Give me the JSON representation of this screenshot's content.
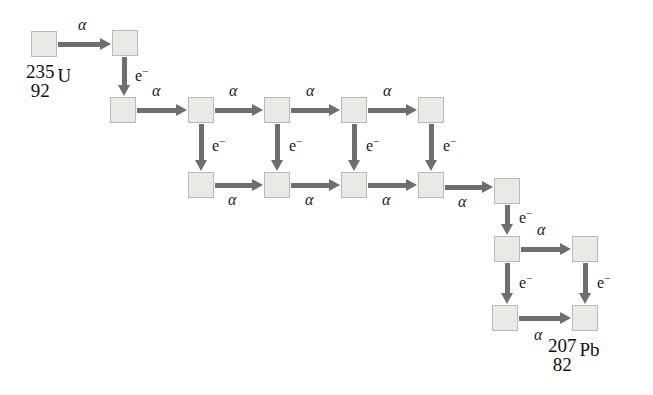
{
  "diagram": {
    "colors": {
      "box_fill": "#e9e9e6",
      "box_border": "#b9b9b5",
      "arrow": "#6e6e6e",
      "text": "#111111",
      "background": "#ffffff"
    },
    "labels": {
      "alpha": "α",
      "electron_base": "e",
      "electron_sup": "−"
    },
    "nuclides": [
      {
        "id": "start",
        "mass": "235",
        "atomic": "92",
        "symbol": "U"
      },
      {
        "id": "end",
        "mass": "207",
        "atomic": "82",
        "symbol": "Pb"
      }
    ],
    "boxes": [
      {
        "name": "nuclide-box-r1-c1",
        "x": 31,
        "y": 31
      },
      {
        "name": "nuclide-box-r1-c2",
        "x": 112,
        "y": 30
      },
      {
        "name": "nuclide-box-r2-c1",
        "x": 110,
        "y": 97
      },
      {
        "name": "nuclide-box-r2-c2",
        "x": 188,
        "y": 97
      },
      {
        "name": "nuclide-box-r2-c3",
        "x": 264,
        "y": 97
      },
      {
        "name": "nuclide-box-r2-c4",
        "x": 341,
        "y": 97
      },
      {
        "name": "nuclide-box-r2-c5",
        "x": 418,
        "y": 97
      },
      {
        "name": "nuclide-box-r3-c1",
        "x": 188,
        "y": 172
      },
      {
        "name": "nuclide-box-r3-c2",
        "x": 264,
        "y": 172
      },
      {
        "name": "nuclide-box-r3-c3",
        "x": 341,
        "y": 172
      },
      {
        "name": "nuclide-box-r3-c4",
        "x": 418,
        "y": 172
      },
      {
        "name": "nuclide-box-r3-c5",
        "x": 494,
        "y": 178
      },
      {
        "name": "nuclide-box-r4-c1",
        "x": 494,
        "y": 236
      },
      {
        "name": "nuclide-box-r4-c2",
        "x": 572,
        "y": 236
      },
      {
        "name": "nuclide-box-r5-c1",
        "x": 492,
        "y": 305
      },
      {
        "name": "nuclide-box-r5-c2",
        "x": 572,
        "y": 305
      }
    ],
    "alpha_arrows": [
      {
        "name": "alpha-arrow-r1-c1-c2",
        "x": 58,
        "y": 42,
        "len": 43,
        "label_x": 78,
        "label_y": 17
      },
      {
        "name": "alpha-arrow-r2-c1-c2",
        "x": 137,
        "y": 108,
        "len": 40,
        "label_x": 152,
        "label_y": 83
      },
      {
        "name": "alpha-arrow-r2-c2-c3",
        "x": 215,
        "y": 108,
        "len": 38,
        "label_x": 229,
        "label_y": 83
      },
      {
        "name": "alpha-arrow-r2-c3-c4",
        "x": 291,
        "y": 108,
        "len": 39,
        "label_x": 306,
        "label_y": 83
      },
      {
        "name": "alpha-arrow-r2-c4-c5",
        "x": 368,
        "y": 108,
        "len": 39,
        "label_x": 383,
        "label_y": 83
      },
      {
        "name": "alpha-arrow-r3-c1-c2",
        "x": 215,
        "y": 183,
        "len": 38,
        "label_x": 228,
        "label_y": 192
      },
      {
        "name": "alpha-arrow-r3-c2-c3",
        "x": 291,
        "y": 183,
        "len": 39,
        "label_x": 305,
        "label_y": 192
      },
      {
        "name": "alpha-arrow-r3-c3-c4",
        "x": 368,
        "y": 183,
        "len": 39,
        "label_x": 382,
        "label_y": 192
      },
      {
        "name": "alpha-arrow-r3-c4-c5",
        "x": 445,
        "y": 185,
        "len": 38,
        "label_x": 458,
        "label_y": 194
      },
      {
        "name": "alpha-arrow-r4-c1-c2",
        "x": 521,
        "y": 247,
        "len": 40,
        "label_x": 537,
        "label_y": 222
      },
      {
        "name": "alpha-arrow-r5-c1-c2",
        "x": 519,
        "y": 316,
        "len": 42,
        "label_x": 534,
        "label_y": 327
      }
    ],
    "electron_arrows": [
      {
        "name": "electron-arrow-r1c2-r2c1",
        "x": 122,
        "y": 57,
        "len": 29,
        "label_x": 135,
        "label_y": 66
      },
      {
        "name": "electron-arrow-r2c2-r3c1",
        "x": 199,
        "y": 124,
        "len": 37,
        "label_x": 212,
        "label_y": 136
      },
      {
        "name": "electron-arrow-r2c3-r3c2",
        "x": 275,
        "y": 124,
        "len": 37,
        "label_x": 289,
        "label_y": 136
      },
      {
        "name": "electron-arrow-r2c4-r3c3",
        "x": 352,
        "y": 124,
        "len": 37,
        "label_x": 366,
        "label_y": 136
      },
      {
        "name": "electron-arrow-r2c5-r3c4",
        "x": 429,
        "y": 124,
        "len": 37,
        "label_x": 443,
        "label_y": 136
      },
      {
        "name": "electron-arrow-r3c5-r4c1",
        "x": 505,
        "y": 205,
        "len": 20,
        "label_x": 519,
        "label_y": 208
      },
      {
        "name": "electron-arrow-r4c1-r5c1",
        "x": 505,
        "y": 263,
        "len": 31,
        "label_x": 519,
        "label_y": 273
      },
      {
        "name": "electron-arrow-r4c2-r5c2",
        "x": 583,
        "y": 263,
        "len": 31,
        "label_x": 597,
        "label_y": 273
      }
    ],
    "nuclide_labels": [
      {
        "name": "nuclide-label-u235",
        "x": 26,
        "y": 62,
        "nuclide_index": 0
      },
      {
        "name": "nuclide-label-pb207",
        "x": 548,
        "y": 336,
        "nuclide_index": 1
      }
    ]
  }
}
